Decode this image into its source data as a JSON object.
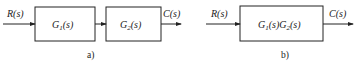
{
  "diagram_a": {
    "caption": "a)",
    "input_label": "R(s)",
    "output_label": "C(s)",
    "blocks": [
      {
        "name": "G",
        "sub": "1",
        "arg": "(s)"
      },
      {
        "name": "G",
        "sub": "2",
        "arg": "(s)"
      }
    ]
  },
  "diagram_b": {
    "caption": "b)",
    "input_label": "R(s)",
    "output_label": "C(s)",
    "block": {
      "g1": "G",
      "sub1": "1",
      "arg1": "(s)",
      "g2": "G",
      "sub2": "2",
      "arg2": "(s)"
    }
  },
  "colors": {
    "stroke": "#222222",
    "background": "#ffffff"
  }
}
